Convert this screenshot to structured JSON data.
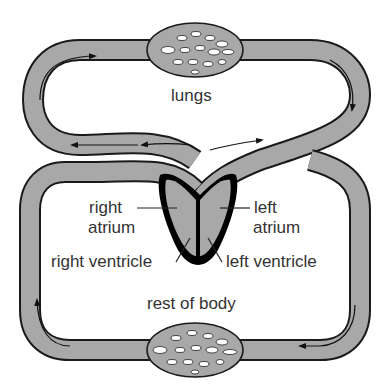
{
  "diagram": {
    "labels": {
      "lungs": "lungs",
      "right_atrium_1": "right",
      "right_atrium_2": "atrium",
      "left_atrium_1": "left",
      "left_atrium_2": "atrium",
      "right_ventricle": "right ventricle",
      "left_ventricle": "left ventricle",
      "rest_of_body": "rest of body"
    },
    "colors": {
      "vessel_fill": "#a8a8a8",
      "outline": "#1a1a1a",
      "heart_muscle": "#000000",
      "background": "#ffffff"
    }
  }
}
